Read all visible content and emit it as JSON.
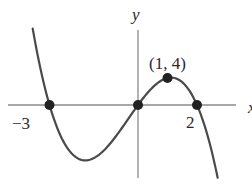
{
  "figure": {
    "axis_labels": {
      "x": "x",
      "y": "y"
    },
    "tick_labels": {
      "neg3": "−3",
      "pos2": "2"
    },
    "point_label": "(1, 4)",
    "colors": {
      "curve": "#4a4a4a",
      "axes": "#8a8a8a",
      "points": "#222222",
      "text": "#2a2a2a",
      "background": "#ffffff"
    }
  },
  "chart_data": {
    "type": "line",
    "title": "",
    "function": "f(x) = -x(x+3)(x-2)",
    "xlabel": "x",
    "ylabel": "y",
    "marked_points": [
      {
        "x": -3,
        "y": 0,
        "label": "-3"
      },
      {
        "x": 0,
        "y": 0,
        "label": ""
      },
      {
        "x": 1,
        "y": 4,
        "label": "(1, 4)"
      },
      {
        "x": 2,
        "y": 0,
        "label": "2"
      }
    ],
    "x_range": [
      -3.57,
      2.7
    ],
    "y_range": [
      -10.8,
      11.1
    ],
    "grid": false,
    "legend": null
  }
}
